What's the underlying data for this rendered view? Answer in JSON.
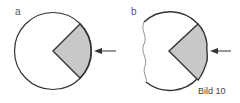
{
  "figure": {
    "caption": "Bild 10",
    "panels": [
      {
        "label": "a",
        "description": "full circle with shaded sector, arrow pointing at sector"
      },
      {
        "label": "b",
        "description": "circle with wavy cut edges and shaded sector, arrow pointing at sector"
      }
    ]
  },
  "colors": {
    "stroke": "#333333",
    "shade": "#c8c8c8"
  }
}
